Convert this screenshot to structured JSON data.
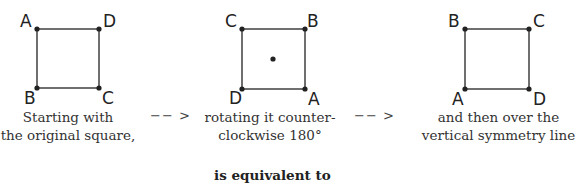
{
  "squares": [
    {
      "id": "original",
      "labels": {
        "top_left": "A",
        "top_right": "D",
        "bottom_left": "B",
        "bottom_right": "C"
      },
      "center_dot": false,
      "caption_lines": [
        "Starting with",
        "the original square,"
      ]
    },
    {
      "id": "rotated",
      "labels": {
        "top_left": "C",
        "top_right": "B",
        "bottom_left": "D",
        "bottom_right": "A"
      },
      "center_dot": true,
      "caption_lines": [
        "rotating it counter-",
        "clockwise 180°"
      ]
    },
    {
      "id": "reflected",
      "labels": {
        "top_left": "B",
        "top_right": "C",
        "bottom_left": "A",
        "bottom_right": "D"
      },
      "center_dot": false,
      "caption_lines": [
        "and then over the",
        "vertical symmetry line"
      ]
    }
  ],
  "arrows": [
    "−− >",
    "−− >"
  ],
  "footer": "is equivalent to"
}
